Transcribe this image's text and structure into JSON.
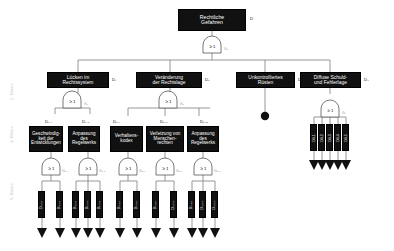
{
  "diagram": {
    "title_node": {
      "label": "Rechtliche\nGefahren",
      "tag": "D"
    },
    "levels": [
      {
        "label": "2. Ebene"
      },
      {
        "label": "3. Ebene"
      },
      {
        "label": "5. Ebene"
      }
    ],
    "gate_symbol": "≥ 1",
    "top_gate_label": "G₀",
    "level2": [
      {
        "label": "Lücken im\nRechtssystem",
        "tag": "D₁",
        "gate_label": "G₁"
      },
      {
        "label": "Veränderung\nder Rechtslage",
        "tag": "D₂",
        "gate_label": "G₂"
      },
      {
        "label": "Unkontrolliertes\nRüsten",
        "tag": "D₃",
        "gate_label": ""
      },
      {
        "label": "Diffuse Schuld-\nund Fehlerlage",
        "tag": "D₄",
        "gate_label": "G₄"
      }
    ],
    "level3": [
      {
        "label": "Geschwindig-\nkeit der\nEntwicklungen",
        "tag": "D₁.₁",
        "gate_label": "G₁.₁"
      },
      {
        "label": "Anpassung\ndes\nRegelwerks",
        "tag": "D₁.₂",
        "gate_label": "G₁.₂"
      },
      {
        "label": "Verhaltens-\nkodex",
        "tag": "D₂.₁",
        "gate_label": "G₂.₁"
      },
      {
        "label": "Verletzung von\nMenschen-\nrechten",
        "tag": "D₂.₂",
        "gate_label": "G₂.₂"
      },
      {
        "label": "Anpassung\ndes\nRegelwerks",
        "tag": "D₂.₃",
        "gate_label": "G₂.₃"
      }
    ],
    "leaf_groups": [
      {
        "parent": "D₁.₁",
        "leaves": [
          "D₁.₁.₁",
          "D₁.₁.₂"
        ]
      },
      {
        "parent": "D₁.₂",
        "leaves": [
          "D₁.₂.₁",
          "D₁.₂.₂",
          "D₁.₂.₃"
        ]
      },
      {
        "parent": "D₂.₁",
        "leaves": [
          "D₂.₁.₁",
          "D₂.₁.₂"
        ]
      },
      {
        "parent": "D₂.₂",
        "leaves": [
          "D₂.₂.₁",
          "D₂.₂.₂"
        ]
      },
      {
        "parent": "D₂.₃",
        "leaves": [
          "D₂.₃.₁",
          "D₂.₃.₂",
          "D₂.₃.₃"
        ]
      }
    ],
    "d4_leaves": [
      "D4.1",
      "D4.2",
      "D4.3",
      "D4.4",
      "D4.5"
    ],
    "colors": {
      "node_fill": "#111111",
      "node_text": "#ffffff",
      "wire": "#7d7d7d",
      "gate_outline": "#555555",
      "level_text": "#c9c9c9"
    }
  }
}
